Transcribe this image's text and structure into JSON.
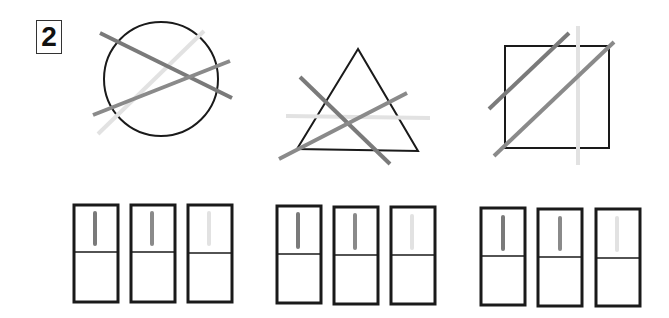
{
  "problem_number": "2",
  "colors": {
    "outline": "#1a1a1a",
    "dark_line": "#7a7a7a",
    "mid_line": "#8a8a8a",
    "light_line": "#e2e2e2"
  },
  "figures": [
    {
      "shape": "circle",
      "cx": 161,
      "cy": 79,
      "r": 57,
      "lines": [
        {
          "tone": "dark",
          "x1": 100,
          "y1": 33,
          "x2": 232,
          "y2": 98
        },
        {
          "tone": "mid",
          "x1": 93,
          "y1": 115,
          "x2": 230,
          "y2": 61
        },
        {
          "tone": "light",
          "x1": 98,
          "y1": 134,
          "x2": 204,
          "y2": 31
        }
      ]
    },
    {
      "shape": "triangle",
      "points": "358,49 297,149 418,151",
      "lines": [
        {
          "tone": "dark",
          "x1": 300,
          "y1": 77,
          "x2": 390,
          "y2": 164
        },
        {
          "tone": "mid",
          "x1": 279,
          "y1": 159,
          "x2": 407,
          "y2": 93
        },
        {
          "tone": "light",
          "x1": 286,
          "y1": 116,
          "x2": 430,
          "y2": 118
        }
      ]
    },
    {
      "shape": "square",
      "x": 505,
      "y": 46,
      "w": 104,
      "h": 102,
      "lines": [
        {
          "tone": "dark",
          "x1": 489,
          "y1": 109,
          "x2": 569,
          "y2": 33
        },
        {
          "tone": "mid",
          "x1": 494,
          "y1": 156,
          "x2": 614,
          "y2": 42
        },
        {
          "tone": "light",
          "x1": 578,
          "y1": 26,
          "x2": 578,
          "y2": 165
        }
      ]
    }
  ],
  "answer_groups": [
    {
      "y": 204,
      "boxes": [
        73,
        130,
        188
      ]
    },
    {
      "y": 206,
      "boxes": [
        277,
        334,
        391
      ]
    },
    {
      "y": 208,
      "boxes": [
        481,
        538,
        595
      ]
    }
  ]
}
